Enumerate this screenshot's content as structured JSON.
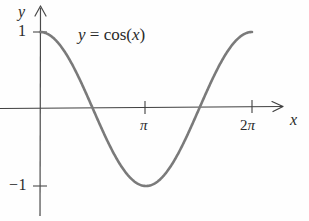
{
  "figure": {
    "kind": "math-function-graph",
    "background_color": "#fefefe"
  },
  "axes": {
    "x_label": "x",
    "y_label": "y",
    "axis_color": "#3a3a3a",
    "origin": {
      "x": 40,
      "y": 108
    },
    "x_ticks": [
      {
        "value": "π",
        "label_num": "",
        "label_sym": "π",
        "px": 145
      },
      {
        "value": "2π",
        "label_num": "2",
        "label_sym": "π",
        "px": 252
      }
    ],
    "y_ticks": [
      {
        "value": "1",
        "label": "1",
        "px": 32
      },
      {
        "value": "-1",
        "label": "−1",
        "px": 186
      }
    ]
  },
  "annotations": {
    "equation_lhs": "y",
    "equation_eq": " = ",
    "equation_fn": "cos",
    "equation_open": "(",
    "equation_arg": "x",
    "equation_close": ")"
  },
  "chart_data": {
    "type": "line",
    "title": "y = cos(x)",
    "xlabel": "x",
    "ylabel": "y",
    "xlim": [
      0,
      6.2832
    ],
    "ylim": [
      -1,
      1
    ],
    "grid": false,
    "legend": null,
    "xtick_labels": [
      "π",
      "2π"
    ],
    "xtick_values": [
      3.1416,
      6.2832
    ],
    "ytick_labels": [
      "1",
      "−1"
    ],
    "ytick_values": [
      1,
      -1
    ],
    "series": [
      {
        "name": "y = cos(x)",
        "color": "#7a7a7a",
        "linewidth": 2.6,
        "x": [
          0,
          0.2618,
          0.5236,
          0.7854,
          1.0472,
          1.309,
          1.5708,
          1.8326,
          2.0944,
          2.3562,
          2.618,
          2.8798,
          3.1416,
          3.4034,
          3.6652,
          3.927,
          4.1888,
          4.4506,
          4.7124,
          4.9742,
          5.236,
          5.4978,
          5.7596,
          6.0214,
          6.2832
        ],
        "y": [
          1.0,
          0.9659,
          0.866,
          0.7071,
          0.5,
          0.2588,
          0.0,
          -0.2588,
          -0.5,
          -0.7071,
          -0.866,
          -0.9659,
          -1.0,
          -0.9659,
          -0.866,
          -0.7071,
          -0.5,
          -0.2588,
          0.0,
          0.2588,
          0.5,
          0.7071,
          0.866,
          0.9659,
          1.0
        ]
      }
    ],
    "annotations": [
      {
        "text": "y = cos(x)",
        "x": 1.1,
        "y": 0.92
      }
    ]
  }
}
